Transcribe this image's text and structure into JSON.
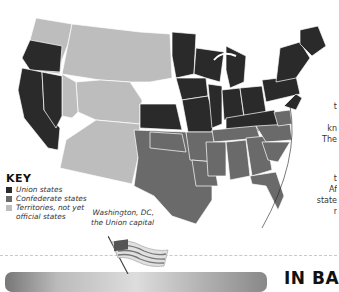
{
  "key": {
    "title": "KEY",
    "items": [
      {
        "label": "Union states",
        "color": "#2a2a2a"
      },
      {
        "label": "Confederate states",
        "color": "#6a6a6a"
      },
      {
        "label": "Territories, not yet",
        "label2": "official states",
        "color": "#bdbdbd"
      }
    ]
  },
  "callout": {
    "line1": "Washington, DC,",
    "line2": "the Union capital"
  },
  "side_text": {
    "lines": [
      "t",
      "",
      "kn",
      "The",
      "",
      "",
      "t",
      "Af",
      "state",
      "r"
    ]
  },
  "heading": {
    "prefix": "IN ",
    "bold": "BA"
  },
  "colors": {
    "union": "#2a2a2a",
    "confederate": "#6a6a6a",
    "territory": "#bdbdbd"
  }
}
